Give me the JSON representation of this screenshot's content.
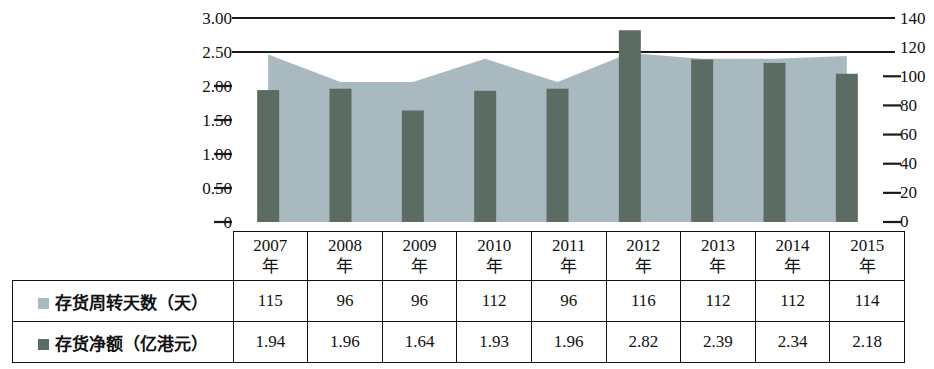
{
  "chart_data": {
    "type": "bar",
    "title": "",
    "subtitle": "",
    "xlabel": "",
    "categories": [
      "2007年",
      "2008年",
      "2009年",
      "2010年",
      "2011年",
      "2012年",
      "2013年",
      "2014年",
      "2015年"
    ],
    "grid": true,
    "legend_position": "table-row-labels",
    "series": [
      {
        "name": "存货周转天数（天）",
        "type": "area",
        "axis": "right",
        "color": "#a9b9c0",
        "values": [
          115,
          96,
          96,
          112,
          96,
          116,
          112,
          112,
          114
        ]
      },
      {
        "name": "存货净额（亿港元）",
        "type": "bar",
        "axis": "left",
        "color": "#5c6c62",
        "values": [
          1.94,
          1.96,
          1.64,
          1.93,
          1.96,
          2.82,
          2.39,
          2.34,
          2.18
        ]
      }
    ],
    "left_axis": {
      "label": "",
      "ylim": [
        0,
        3.0
      ],
      "ticks": [
        "0",
        "0.50",
        "1.00",
        "1.50",
        "2.00",
        "2.50",
        "3.00"
      ],
      "tick_values": [
        0,
        0.5,
        1.0,
        1.5,
        2.0,
        2.5,
        3.0
      ]
    },
    "right_axis": {
      "label": "",
      "ylim": [
        0,
        140
      ],
      "ticks": [
        "0",
        "20",
        "40",
        "60",
        "80",
        "100",
        "120",
        "140"
      ],
      "tick_values": [
        0,
        20,
        40,
        60,
        80,
        100,
        120,
        140
      ]
    }
  },
  "table": {
    "year_suffix": "年",
    "year_numbers": [
      "2007",
      "2008",
      "2009",
      "2010",
      "2011",
      "2012",
      "2013",
      "2014",
      "2015"
    ],
    "rows": [
      {
        "label": "存货周转天数（天）",
        "swatch_color": "#a9b9c0",
        "values": [
          "115",
          "96",
          "96",
          "112",
          "96",
          "116",
          "112",
          "112",
          "114"
        ]
      },
      {
        "label": "存货净额（亿港元）",
        "swatch_color": "#5c6c62",
        "values": [
          "1.94",
          "1.96",
          "1.64",
          "1.93",
          "1.96",
          "2.82",
          "2.39",
          "2.34",
          "2.18"
        ]
      }
    ]
  },
  "colors": {
    "area_fill": "#a9b9c0",
    "bar_fill": "#5c6c62",
    "axis_line": "#1a1a1a",
    "text": "#111111",
    "background": "#ffffff"
  }
}
